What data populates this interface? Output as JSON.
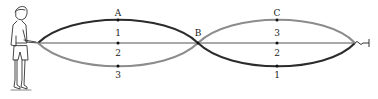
{
  "diagram": {
    "labels": {
      "A": "A",
      "B": "B",
      "C": "C",
      "A1": "1",
      "A2": "2",
      "A3": "3",
      "C3": "3",
      "C2": "2",
      "C1": "1"
    },
    "colors": {
      "dark_rope": "#2b2b2b",
      "light_rope": "#8c8c8c",
      "axis_line": "#555555",
      "person": "#333333"
    }
  }
}
